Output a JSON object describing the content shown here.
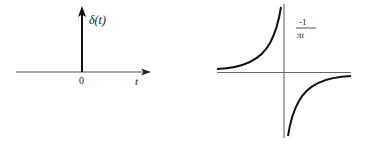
{
  "diagrams": [
    {
      "name": "impulse",
      "impulse_label": "δ(t)",
      "origin_label": "0",
      "axis_label": "t"
    },
    {
      "name": "hilbert-kernel",
      "numerator": "-1",
      "denominator": "πt"
    }
  ],
  "colors": {
    "stroke": "#111111",
    "axis": "#555555",
    "background": "#ffffff"
  }
}
